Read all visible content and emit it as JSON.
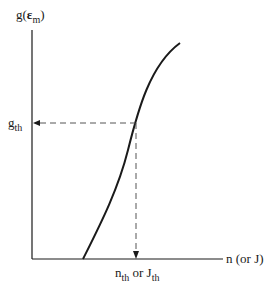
{
  "diagram": {
    "type": "gain-vs-carrier-density",
    "y_axis": {
      "label_main": "g(",
      "label_symbol": "ε",
      "label_sub": "m",
      "label_close": ")"
    },
    "x_axis": {
      "label": "n (or J)"
    },
    "threshold_y": {
      "main": "g",
      "sub": "th"
    },
    "threshold_x": {
      "main1": "n",
      "sub1": "th",
      "mid": " or J",
      "sub2": "th"
    },
    "colors": {
      "line": "#1a1a1a",
      "dash": "#555555",
      "background": "#ffffff"
    }
  }
}
